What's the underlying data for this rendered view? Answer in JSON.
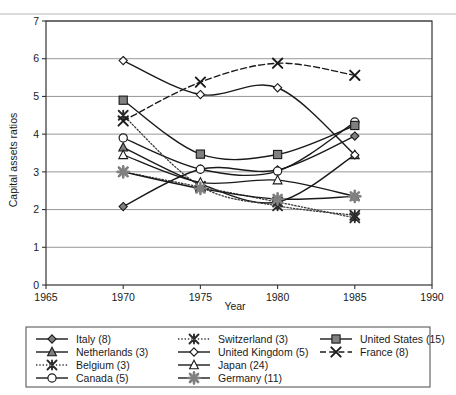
{
  "chart_data": {
    "type": "line",
    "title": "",
    "xlabel": "Year",
    "ylabel": "Capital assets ratios",
    "xlim": [
      1965,
      1990
    ],
    "ylim": [
      0,
      7
    ],
    "xticks": [
      "1965",
      "1970",
      "1975",
      "1980",
      "1985",
      "1990"
    ],
    "yticks": [
      "0",
      "1",
      "2",
      "3",
      "4",
      "5",
      "6",
      "7"
    ],
    "grid": true,
    "legend_position": "bottom",
    "x": [
      1970,
      1975,
      1980,
      1985
    ],
    "series": [
      {
        "name": "Italy (8)",
        "label": "Italy (8)",
        "count": 8,
        "values": [
          2.08,
          3.07,
          3.05,
          3.95
        ],
        "marker": "diamond-filled",
        "color": "#808080",
        "line": "solid"
      },
      {
        "name": "Netherlands (3)",
        "label": "Netherlands (3)",
        "count": 3,
        "values": [
          3.65,
          2.68,
          2.2,
          3.45
        ],
        "marker": "triangle-filled",
        "color": "#808080",
        "line": "solid"
      },
      {
        "name": "Belgium (3)",
        "label": "Belgium (3)",
        "count": 3,
        "values": [
          3.0,
          2.6,
          2.2,
          1.78
        ],
        "marker": "x-star-filled",
        "color": "#3a3a3a",
        "line": "dotted"
      },
      {
        "name": "Canada (5)",
        "label": "Canada (5)",
        "count": 5,
        "values": [
          3.9,
          3.07,
          3.02,
          4.32
        ],
        "marker": "circle-open",
        "color": "#1a1a1a",
        "line": "solid"
      },
      {
        "name": "Switzerland (3)",
        "label": "Switzerland (3)",
        "count": 3,
        "values": [
          4.5,
          2.62,
          2.1,
          1.85
        ],
        "marker": "x-star-filled",
        "color": "#3a3a3a",
        "line": "dotted"
      },
      {
        "name": "United Kingdom (5)",
        "label": "United Kingdom (5)",
        "count": 5,
        "values": [
          5.95,
          5.05,
          5.23,
          3.45
        ],
        "marker": "diamond-open",
        "color": "#1a1a1a",
        "line": "solid"
      },
      {
        "name": "Japan (24)",
        "label": "Japan (24)",
        "count": 24,
        "values": [
          3.45,
          2.72,
          2.78,
          2.35
        ],
        "marker": "triangle-open",
        "color": "#1a1a1a",
        "line": "solid"
      },
      {
        "name": "Germany (11)",
        "label": "Germany (11)",
        "count": 11,
        "values": [
          3.0,
          2.56,
          2.28,
          2.35
        ],
        "marker": "asterisk-filled",
        "color": "#808080",
        "line": "solid"
      },
      {
        "name": "United States (15)",
        "label": "United States (15)",
        "count": 15,
        "values": [
          4.9,
          3.47,
          3.46,
          4.23
        ],
        "marker": "square-filled",
        "color": "#808080",
        "line": "solid"
      },
      {
        "name": "France (8)",
        "label": "France (8)",
        "count": 8,
        "values": [
          4.35,
          5.38,
          5.88,
          5.56
        ],
        "marker": "x-bold",
        "color": "#1a1a1a",
        "line": "dashed"
      }
    ]
  },
  "legend": {
    "columns": [
      [
        "Italy (8)",
        "Netherlands (3)",
        "Belgium (3)",
        "Canada (5)"
      ],
      [
        "Switzerland (3)",
        "United Kingdom (5)",
        "Japan (24)",
        "Germany (11)"
      ],
      [
        "United States (15)",
        "France (8)"
      ]
    ]
  }
}
